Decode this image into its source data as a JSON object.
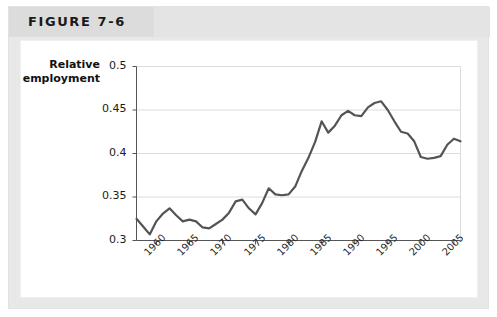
{
  "figure": {
    "title": "FIGURE 7-6"
  },
  "chart_data": {
    "type": "line",
    "title": "",
    "xlabel": "",
    "ylabel": "Relative employment",
    "ylabel_lines": [
      "Relative",
      "employment"
    ],
    "xlim": [
      1957,
      2006
    ],
    "ylim": [
      0.3,
      0.5
    ],
    "yticks": [
      0.3,
      0.35,
      0.4,
      0.45,
      0.5
    ],
    "ytick_labels": [
      "0.3",
      "0.35",
      "0.4",
      "0.45",
      "0.5"
    ],
    "xticks": [
      1960,
      1965,
      1970,
      1975,
      1980,
      1985,
      1990,
      1995,
      2000,
      2005
    ],
    "xtick_labels": [
      "1960",
      "1965",
      "1970",
      "1975",
      "1980",
      "1985",
      "1990",
      "1995",
      "2000",
      "2005"
    ],
    "grid": "horizontal",
    "legend": "none",
    "line_color": "#545454",
    "grid_color": "#dcdcdc",
    "axis_color": "#555555",
    "series": [
      {
        "name": "Relative employment",
        "x": [
          1957,
          1958,
          1959,
          1960,
          1961,
          1962,
          1963,
          1964,
          1965,
          1966,
          1967,
          1968,
          1969,
          1970,
          1971,
          1972,
          1973,
          1974,
          1975,
          1976,
          1977,
          1978,
          1979,
          1980,
          1981,
          1982,
          1983,
          1984,
          1985,
          1986,
          1987,
          1988,
          1989,
          1990,
          1991,
          1992,
          1993,
          1994,
          1995,
          1996,
          1997,
          1998,
          1999,
          2000,
          2001,
          2002,
          2003,
          2004,
          2005,
          2006
        ],
        "values": [
          0.325,
          0.316,
          0.307,
          0.322,
          0.331,
          0.337,
          0.329,
          0.322,
          0.324,
          0.322,
          0.315,
          0.314,
          0.319,
          0.324,
          0.332,
          0.345,
          0.347,
          0.337,
          0.33,
          0.343,
          0.36,
          0.353,
          0.352,
          0.353,
          0.362,
          0.38,
          0.395,
          0.413,
          0.437,
          0.424,
          0.432,
          0.444,
          0.449,
          0.444,
          0.443,
          0.453,
          0.458,
          0.46,
          0.45,
          0.437,
          0.425,
          0.423,
          0.414,
          0.396,
          0.394,
          0.395,
          0.397,
          0.41,
          0.417,
          0.414
        ]
      }
    ]
  }
}
